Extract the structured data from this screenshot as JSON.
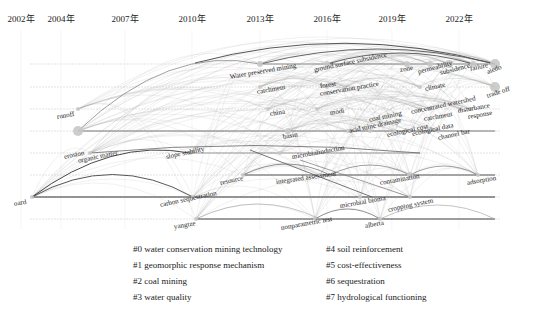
{
  "chart_data": {
    "type": "timeline",
    "title": "",
    "xlabel": "",
    "ylabel": "",
    "years": [
      "2002年",
      "2004年",
      "2007年",
      "2010年",
      "2013年",
      "2016年",
      "2019年",
      "2022年"
    ],
    "year_x": [
      21,
      61,
      125,
      192,
      260,
      327,
      392,
      459
    ],
    "grid": true,
    "rows_y": [
      64,
      87,
      109,
      131,
      153,
      175,
      197,
      219
    ],
    "clusters": [
      {
        "id": "#0",
        "label": "water conservation mining technology"
      },
      {
        "id": "#1",
        "label": "geomorphic response mechanism"
      },
      {
        "id": "#2",
        "label": "coal mining"
      },
      {
        "id": "#3",
        "label": "water quality"
      },
      {
        "id": "#4",
        "label": "soil reinforcement"
      },
      {
        "id": "#5",
        "label": "cost-effectiveness"
      },
      {
        "id": "#6",
        "label": "sequestration"
      },
      {
        "id": "#7",
        "label": "hydrological functioning"
      }
    ],
    "nodes": [
      {
        "label": "Water preserved mining",
        "x": 260,
        "y": 64,
        "r": 3,
        "lx": 230,
        "ly": 77,
        "rot": -10
      },
      {
        "label": "ground surface subsidence",
        "x": 327,
        "y": 64,
        "r": 3,
        "lx": 314,
        "ly": 70,
        "rot": -12
      },
      {
        "label": "zone",
        "x": 407,
        "y": 64,
        "r": 3,
        "lx": 400,
        "ly": 70,
        "rot": -10
      },
      {
        "label": "permeability",
        "x": 430,
        "y": 64,
        "r": 3,
        "lx": 418,
        "ly": 72,
        "rot": -15
      },
      {
        "label": "subsidence",
        "x": 449,
        "y": 64,
        "r": 4,
        "lx": 440,
        "ly": 73,
        "rot": -14
      },
      {
        "label": "failure",
        "x": 473,
        "y": 64,
        "r": 3,
        "lx": 470,
        "ly": 69,
        "rot": -12
      },
      {
        "label": "aiedo",
        "x": 495,
        "y": 64,
        "r": 5,
        "lx": 487,
        "ly": 72,
        "rot": -20
      },
      {
        "label": "catchment",
        "x": 260,
        "y": 87,
        "r": 2,
        "lx": 257,
        "ly": 92,
        "rot": -10
      },
      {
        "label": "forest",
        "x": 327,
        "y": 87,
        "r": 2,
        "lx": 320,
        "ly": 86,
        "rot": -8
      },
      {
        "label": "conservation practice",
        "x": 345,
        "y": 87,
        "r": 2,
        "lx": 320,
        "ly": 94,
        "rot": -10
      },
      {
        "label": "climate",
        "x": 420,
        "y": 87,
        "r": 2,
        "lx": 425,
        "ly": 89,
        "rot": -12
      },
      {
        "label": "trade off",
        "x": 495,
        "y": 87,
        "r": 5,
        "lx": 487,
        "ly": 96,
        "rot": -18
      },
      {
        "label": "runoff",
        "x": 78,
        "y": 109,
        "r": 2,
        "lx": 57,
        "ly": 117,
        "rot": -10
      },
      {
        "label": "china",
        "x": 268,
        "y": 109,
        "r": 2,
        "lx": 270,
        "ly": 114,
        "rot": -10
      },
      {
        "label": "modi",
        "x": 317,
        "y": 109,
        "r": 2,
        "lx": 330,
        "ly": 113,
        "rot": -10
      },
      {
        "label": "concentrated watershed",
        "x": 420,
        "y": 109,
        "r": 2,
        "lx": 411,
        "ly": 112,
        "rot": -12
      },
      {
        "label": "catchment",
        "x": 430,
        "y": 109,
        "r": 2,
        "lx": 424,
        "ly": 119,
        "rot": -10
      },
      {
        "label": "disturbance",
        "x": 460,
        "y": 109,
        "r": 2,
        "lx": 458,
        "ly": 111,
        "rot": -10
      },
      {
        "label": "response",
        "x": 470,
        "y": 109,
        "r": 2,
        "lx": 468,
        "ly": 117,
        "rot": -10
      },
      {
        "label": "erosion",
        "x": 78,
        "y": 131,
        "r": 5,
        "lx": 64,
        "ly": 157,
        "rot": -12
      },
      {
        "label": "basin",
        "x": 288,
        "y": 131,
        "r": 3,
        "lx": 283,
        "ly": 137,
        "rot": -10
      },
      {
        "label": "coal mining",
        "x": 370,
        "y": 131,
        "r": 2,
        "lx": 369,
        "ly": 120,
        "rot": -12
      },
      {
        "label": "acid mine drainage",
        "x": 348,
        "y": 131,
        "r": 2,
        "lx": 349,
        "ly": 131,
        "rot": -12
      },
      {
        "label": "ecological cost",
        "x": 395,
        "y": 131,
        "r": 2,
        "lx": 387,
        "ly": 135,
        "rot": -12
      },
      {
        "label": "ecological data",
        "x": 410,
        "y": 131,
        "r": 2,
        "lx": 412,
        "ly": 134,
        "rot": -12
      },
      {
        "label": "channel bar",
        "x": 438,
        "y": 131,
        "r": 2,
        "lx": 438,
        "ly": 138,
        "rot": -12
      },
      {
        "label": "organic matter",
        "x": 90,
        "y": 153,
        "r": 2,
        "lx": 78,
        "ly": 161,
        "rot": -12
      },
      {
        "label": "slope stability",
        "x": 190,
        "y": 153,
        "r": 2,
        "lx": 166,
        "ly": 157,
        "rot": -12
      },
      {
        "label": "microbialinduction",
        "x": 280,
        "y": 153,
        "r": 2,
        "lx": 292,
        "ly": 157,
        "rot": -10
      },
      {
        "label": "resource",
        "x": 243,
        "y": 175,
        "r": 2,
        "lx": 220,
        "ly": 183,
        "rot": -12
      },
      {
        "label": "integrated assessment",
        "x": 320,
        "y": 175,
        "r": 2,
        "lx": 276,
        "ly": 182,
        "rot": -8
      },
      {
        "label": "contamination",
        "x": 410,
        "y": 175,
        "r": 3,
        "lx": 380,
        "ly": 183,
        "rot": -10
      },
      {
        "label": "adsorption",
        "x": 478,
        "y": 175,
        "r": 2,
        "lx": 467,
        "ly": 183,
        "rot": -10
      },
      {
        "label": "oard",
        "x": 32,
        "y": 197,
        "r": 2,
        "lx": 14,
        "ly": 204,
        "rot": -10
      },
      {
        "label": "carbon sequestration",
        "x": 193,
        "y": 197,
        "r": 2,
        "lx": 160,
        "ly": 205,
        "rot": -12
      },
      {
        "label": "microbial bioma",
        "x": 360,
        "y": 197,
        "r": 2,
        "lx": 340,
        "ly": 206,
        "rot": -10
      },
      {
        "label": "cropping system",
        "x": 410,
        "y": 197,
        "r": 2,
        "lx": 388,
        "ly": 210,
        "rot": -12
      },
      {
        "label": "yangtze",
        "x": 196,
        "y": 219,
        "r": 2,
        "lx": 174,
        "ly": 227,
        "rot": -10
      },
      {
        "label": "nonparametric test",
        "x": 315,
        "y": 219,
        "r": 2,
        "lx": 281,
        "ly": 228,
        "rot": -10
      },
      {
        "label": "alberta",
        "x": 380,
        "y": 219,
        "r": 2,
        "lx": 365,
        "ly": 226,
        "rot": -10
      }
    ]
  },
  "legend": {
    "left": [
      "#0 water conservation mining technology",
      "#1 geomorphic response mechanism",
      "#2 coal mining",
      "#3 water quality"
    ],
    "right": [
      "#4 soil reinforcement",
      "#5 cost-effectiveness",
      "#6 sequestration",
      "#7 hydrological functioning"
    ]
  }
}
